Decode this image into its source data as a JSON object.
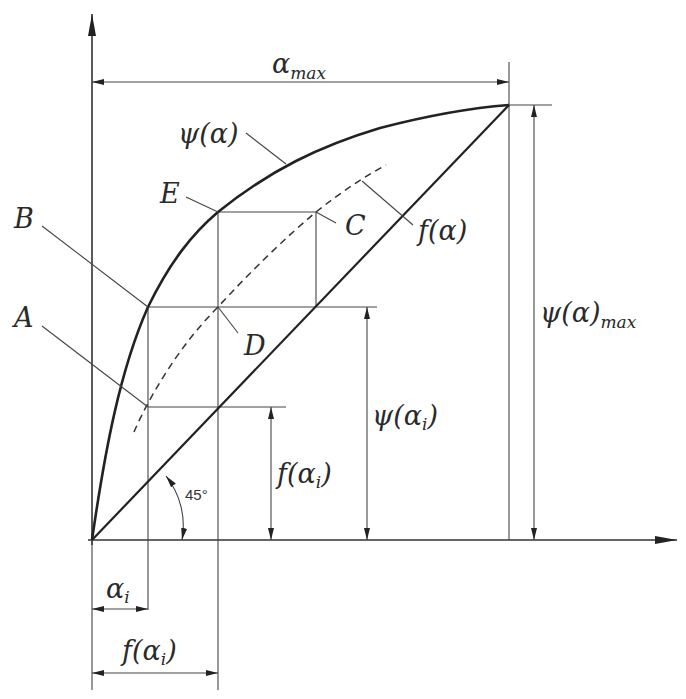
{
  "diagram": {
    "title": "",
    "axes": {
      "x_axis": "horizontal axis (alpha)",
      "y_axis": "vertical axis (psi / f)"
    },
    "curves": {
      "psi": {
        "label": "ψ(α)",
        "style": "solid-thick"
      },
      "f": {
        "label": "f(α)",
        "style": "dashed"
      },
      "diagonal": {
        "angle_label": "45°",
        "style": "solid"
      }
    },
    "points": {
      "A": "A",
      "B": "B",
      "C": "C",
      "D": "D",
      "E": "E"
    },
    "dimensions": {
      "alpha_max": {
        "base": "α",
        "sub": "max"
      },
      "psi_max": {
        "base": "ψ(α)",
        "sub": "max"
      },
      "psi_alpha_i": {
        "pre": "ψ(α",
        "sub": "i",
        "post": ")"
      },
      "f_alpha_i_vertical": {
        "pre": "f(α",
        "sub": "i",
        "post": ")"
      },
      "alpha_i": {
        "base": "α",
        "sub": "i"
      },
      "f_alpha_i_horizontal": {
        "pre": "f(α",
        "sub": "i",
        "post": ")"
      }
    },
    "angle": "45°"
  }
}
